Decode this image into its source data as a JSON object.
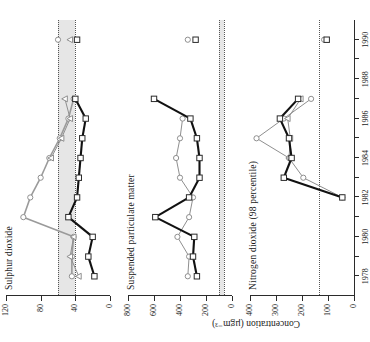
{
  "figure": {
    "yaxis_caption": "Concentration (µgm⁻³)",
    "xaxis_label": "",
    "x_ticks": [
      "1978",
      "1980",
      "1982",
      "1984",
      "1986",
      "1988",
      "1990"
    ],
    "x_tick_values": [
      1978,
      1980,
      1982,
      1984,
      1986,
      1988,
      1990
    ],
    "x_minor_step": 1,
    "xlim": [
      1977,
      1991
    ]
  },
  "chart_data": [
    {
      "type": "line",
      "title": "Sulphur dioxide",
      "xlabel": "",
      "ylabel": "Concentration (µgm⁻³)",
      "ylim": [
        0,
        120
      ],
      "yticks": [
        0,
        40,
        80,
        120
      ],
      "ytick_labels": [
        "0",
        "40",
        "80",
        "120"
      ],
      "grid": false,
      "legend": "none",
      "reference_band": {
        "label": "EC guide range",
        "from": 40,
        "to": 60,
        "color": "#e6e6e6"
      },
      "reference_lines": [
        40,
        60
      ],
      "x": [
        1978,
        1979,
        1980,
        1981,
        1982,
        1983,
        1984,
        1985,
        1986,
        1987,
        1990
      ],
      "series": [
        {
          "name": "Site A (square, black)",
          "marker": "square",
          "color": "#111111",
          "values": [
            18,
            25,
            20,
            48,
            38,
            36,
            34,
            32,
            28,
            40,
            38
          ]
        },
        {
          "name": "Site B (circle, grey)",
          "marker": "circle",
          "color": "#9a9a9a",
          "values": [
            44,
            44,
            42,
            100,
            92,
            80,
            70,
            58,
            48,
            42,
            60
          ]
        },
        {
          "name": "Site C (triangle, grey)",
          "marker": "triangle",
          "color": "#8f8f8f",
          "values": [
            36,
            46,
            42,
            null,
            null,
            null,
            68,
            56,
            46,
            52,
            46
          ]
        }
      ]
    },
    {
      "type": "line",
      "title": "Suspended particulate matter",
      "xlabel": "",
      "ylabel": "Concentration (µgm⁻³)",
      "ylim": [
        0,
        800
      ],
      "yticks": [
        0,
        200,
        400,
        600,
        800
      ],
      "ytick_labels": [
        "0",
        "200",
        "400",
        "600",
        "800"
      ],
      "grid": false,
      "legend": "none",
      "reference_band": {
        "label": "EC limit band",
        "from": 60,
        "to": 100,
        "color": "#e6e6e6"
      },
      "reference_lines": [
        60,
        100
      ],
      "x": [
        1978,
        1979,
        1980,
        1981,
        1982,
        1983,
        1984,
        1985,
        1986,
        1987,
        1990
      ],
      "series": [
        {
          "name": "Site A (square, black)",
          "marker": "square",
          "color": "#111111",
          "values": [
            270,
            300,
            290,
            590,
            330,
            250,
            250,
            270,
            320,
            600,
            280
          ]
        },
        {
          "name": "Site B (circle, grey)",
          "marker": "circle",
          "color": "#8f8f8f",
          "values": [
            340,
            330,
            420,
            330,
            300,
            400,
            430,
            400,
            380,
            null,
            340
          ]
        }
      ]
    },
    {
      "type": "line",
      "title": "Nitrogen dioxide (98 percentile)",
      "xlabel": "",
      "ylabel": "Concentration (µgm⁻³)",
      "ylim": [
        0,
        400
      ],
      "yticks": [
        0,
        100,
        200,
        300,
        400
      ],
      "ytick_labels": [
        "0",
        "100",
        "200",
        "300",
        "400"
      ],
      "grid": false,
      "legend": "none",
      "reference_lines": [
        135
      ],
      "x": [
        1982,
        1983,
        1984,
        1985,
        1986,
        1987,
        1990
      ],
      "series": [
        {
          "name": "Site A (square, black)",
          "marker": "square",
          "color": "#111111",
          "values": [
            45,
            270,
            240,
            250,
            285,
            215,
            105
          ]
        },
        {
          "name": "Site B (circle, grey)",
          "marker": "circle",
          "color": "#8f8f8f",
          "values": [
            45,
            195,
            250,
            375,
            270,
            165,
            115
          ]
        },
        {
          "name": "Site C (triangle, grey)",
          "marker": "triangle",
          "color": "#8f8f8f",
          "values": [
            null,
            null,
            250,
            245,
            255,
            205,
            null
          ]
        }
      ]
    }
  ]
}
